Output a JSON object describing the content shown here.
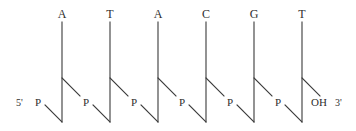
{
  "diagram": {
    "background_color": "#ffffff",
    "line_color": "#3a3a3a",
    "text_color": "#2e2e2e",
    "five_prime_end": {
      "end_label": "5'",
      "group_label": "P"
    },
    "three_prime_end": {
      "group_label": "OH",
      "end_label": "3'"
    },
    "bases": [
      {
        "label": "A",
        "x": 62
      },
      {
        "label": "T",
        "x": 110
      },
      {
        "label": "A",
        "x": 158
      },
      {
        "label": "C",
        "x": 206
      },
      {
        "label": "G",
        "x": 254
      },
      {
        "label": "T",
        "x": 302
      }
    ],
    "phosphates": [
      {
        "label": "P",
        "x": 38
      },
      {
        "label": "P",
        "x": 86
      },
      {
        "label": "P",
        "x": 134
      },
      {
        "label": "P",
        "x": 182
      },
      {
        "label": "P",
        "x": 230
      },
      {
        "label": "P",
        "x": 278
      }
    ],
    "geometry": {
      "base_label_y": 14,
      "vertical_top_y": 22,
      "vertical_bottom_y": 122,
      "branch_y": 78,
      "label_row_y": 103,
      "unit_spacing": 48,
      "first_vertical_x": 62
    }
  }
}
